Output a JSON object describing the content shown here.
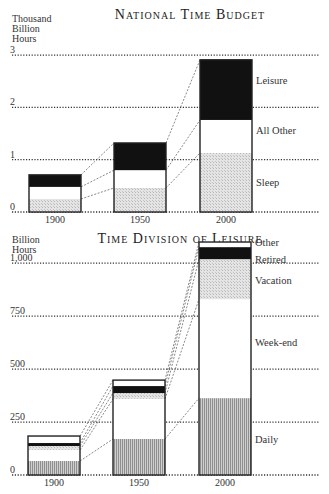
{
  "chart_data": [
    {
      "type": "bar",
      "stacked": true,
      "title": "National Time Budget",
      "ylabel": "Thousand Billion Hours",
      "ylabel_lines": [
        "Thousand",
        "Billion",
        "Hours"
      ],
      "xlabel": "",
      "categories": [
        "1900",
        "1950",
        "2000"
      ],
      "yticks": [
        "0",
        "1",
        "2",
        "3"
      ],
      "ylim": [
        0,
        3
      ],
      "grid": "dotted horizontal",
      "series": [
        {
          "name": "Sleep",
          "fill": "stipple-grey",
          "values": [
            0.25,
            0.46,
            1.13
          ]
        },
        {
          "name": "All Other",
          "fill": "white",
          "values": [
            0.23,
            0.34,
            0.63
          ]
        },
        {
          "name": "Leisure",
          "fill": "black",
          "values": [
            0.23,
            0.52,
            1.15
          ]
        }
      ],
      "totals": [
        0.71,
        1.32,
        2.91
      ],
      "labels_right": [
        "Leisure",
        "All Other",
        "Sleep"
      ]
    },
    {
      "type": "bar",
      "stacked": true,
      "title": "Time Division of Leisure",
      "ylabel": "Billion Hours",
      "ylabel_lines": [
        "Billion",
        "Hours"
      ],
      "xlabel": "",
      "categories": [
        "1900",
        "1950",
        "2000"
      ],
      "yticks": [
        "0",
        "250",
        "500",
        "750",
        "1,000"
      ],
      "ylim": [
        0,
        1100
      ],
      "grid": "dotted horizontal",
      "series": [
        {
          "name": "Daily",
          "fill": "vertical-hatch",
          "values": [
            66,
            170,
            363
          ]
        },
        {
          "name": "Week-end",
          "fill": "white",
          "values": [
            52,
            189,
            467
          ]
        },
        {
          "name": "Vacation",
          "fill": "stipple-grey",
          "values": [
            19,
            28,
            189
          ]
        },
        {
          "name": "Retired",
          "fill": "black",
          "values": [
            14,
            33,
            57
          ]
        },
        {
          "name": "Other",
          "fill": "white",
          "values": [
            33,
            28,
            24
          ]
        }
      ],
      "totals": [
        184,
        448,
        1100
      ],
      "labels_right": [
        "Other",
        "Retired",
        "Vacation",
        "Week-end",
        "Daily"
      ]
    }
  ]
}
